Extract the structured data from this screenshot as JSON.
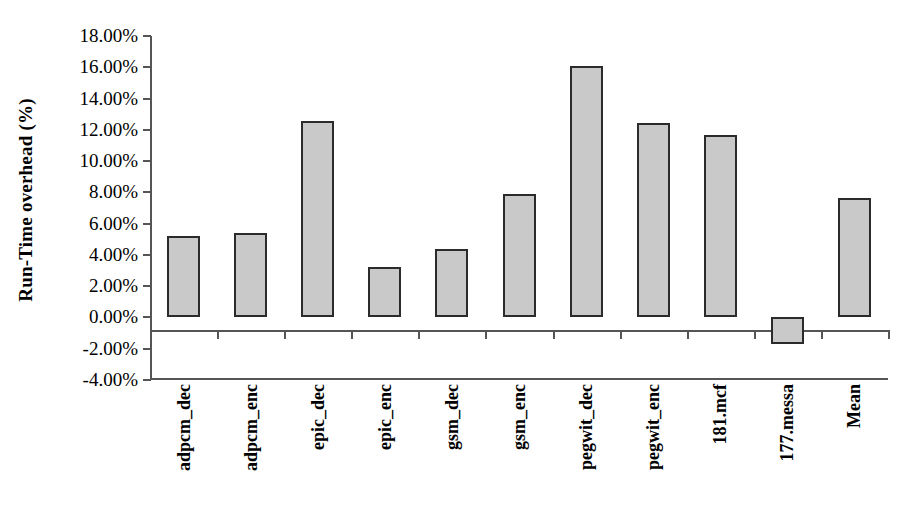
{
  "chart_data": {
    "type": "bar",
    "title": "",
    "subtitle": "",
    "xlabel": "",
    "ylabel": "Run-Time overhead (%)",
    "categories": [
      "adpcm_dec",
      "adpcm_enc",
      "epic_dec",
      "epic_enc",
      "gsm_dec",
      "gsm_enc",
      "pegwit_dec",
      "pegwit_enc",
      "181.mcf",
      "177.messa",
      "Mean"
    ],
    "values": [
      5.2,
      5.4,
      12.55,
      3.2,
      4.4,
      7.9,
      16.05,
      12.45,
      11.7,
      -1.7,
      7.65
    ],
    "value_labels": [
      "5.20%",
      "5.40%",
      "12.55%",
      "3.20%",
      "4.40%",
      "7.90%",
      "16.05%",
      "12.45%",
      "11.70%",
      "-1.70%",
      "7.65%"
    ],
    "ylim": [
      -4,
      18
    ],
    "ytick_values": [
      18,
      16,
      14,
      12,
      10,
      8,
      6,
      4,
      2,
      0,
      -2,
      -4
    ],
    "ytick_labels": [
      "18.00%",
      "16.00%",
      "14.00%",
      "12.00%",
      "10.00%",
      "8.00%",
      "6.00%",
      "4.00%",
      "2.00%",
      "0.00%",
      "-2.00%",
      "-4.00%"
    ],
    "grid": false,
    "legend": false,
    "legend_position": "none",
    "series": [
      {
        "name": "Run-Time overhead",
        "values": [
          5.2,
          5.4,
          12.55,
          3.2,
          4.4,
          7.9,
          16.05,
          12.45,
          11.7,
          -1.7,
          7.65
        ]
      }
    ],
    "bar_fill_color": "#c9c9c9",
    "bar_border_color": "#2b2b2b",
    "axis_color": "#555555",
    "background_color": "#ffffff"
  }
}
